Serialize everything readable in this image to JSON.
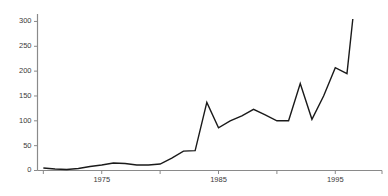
{
  "chart_data": {
    "type": "line",
    "title": "",
    "subtitle": "",
    "xlabel": "",
    "ylabel": "",
    "x": [
      1970,
      1971,
      1972,
      1973,
      1974,
      1975,
      1976,
      1977,
      1978,
      1979,
      1980,
      1981,
      1982,
      1983,
      1984,
      1985,
      1986,
      1987,
      1988,
      1989,
      1990,
      1991,
      1992,
      1993,
      1994,
      1995,
      1996,
      1996.5
    ],
    "values": [
      5,
      3,
      2,
      4,
      8,
      11,
      15,
      14,
      11,
      11,
      13,
      25,
      39,
      40,
      137,
      86,
      100,
      110,
      123,
      112,
      100,
      100,
      175,
      103,
      150,
      207,
      195,
      305
    ],
    "series": [
      {
        "name": "series-1",
        "values": [
          5,
          3,
          2,
          4,
          8,
          11,
          15,
          14,
          11,
          11,
          13,
          25,
          39,
          40,
          137,
          86,
          100,
          110,
          123,
          112,
          100,
          100,
          175,
          103,
          150,
          207,
          195,
          305
        ],
        "color": "#1a1a1a"
      }
    ],
    "xlim": [
      1969.5,
      1999.0
    ],
    "ylim": [
      0,
      315
    ],
    "xticks": [
      1975,
      1985,
      1995
    ],
    "xticklabels": [
      "1975",
      "1985",
      "1995"
    ],
    "xminorticks": [
      1970,
      1980,
      1990,
      1999
    ],
    "yticks": [
      0,
      50,
      100,
      150,
      200,
      250,
      300
    ],
    "yticklabels": [
      "0",
      "50",
      "100",
      "150",
      "200",
      "250",
      "300"
    ],
    "grid": false,
    "legend": null,
    "axis_style": {
      "spines": [
        "left",
        "bottom"
      ],
      "line_color": "#1a1a1a",
      "axis_color": "#8a8a8a",
      "line_width": 1.4
    }
  },
  "axis": {
    "y_labels": [
      "300",
      "250",
      "200",
      "150",
      "100",
      "50",
      "0"
    ],
    "x_labels": [
      "1975",
      "1985",
      "1995"
    ]
  }
}
